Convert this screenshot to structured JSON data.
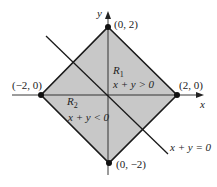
{
  "diagram": {
    "axes": {
      "x_label": "x",
      "y_label": "y"
    },
    "points": [
      {
        "label": "(0, 2)"
      },
      {
        "label": "(2, 0)"
      },
      {
        "label": "(−2, 0)"
      },
      {
        "label": "(0, −2)"
      }
    ],
    "regions": [
      {
        "name": "R",
        "subscript": "1",
        "condition": "x + y > 0"
      },
      {
        "name": "R",
        "subscript": "2",
        "condition": "x + y < 0"
      }
    ],
    "line_label": "x + y = 0",
    "colors": {
      "fill": "#c8c8c8",
      "stroke": "#1a1a1a"
    }
  }
}
